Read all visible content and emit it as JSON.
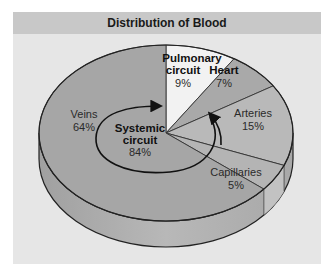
{
  "chart_data": {
    "type": "pie",
    "title": "Distribution of Blood",
    "style": "3d-extruded",
    "slices": [
      {
        "label": "Pulmonary circuit",
        "value": 9,
        "value_label": "9%",
        "color": "#f2f2f2",
        "bold": true
      },
      {
        "label": "Heart",
        "value": 7,
        "value_label": "7%",
        "color": "#a9a9a9",
        "bold": true
      },
      {
        "label": "Arteries",
        "value": 15,
        "value_label": "15%",
        "color": "#b9b9b9",
        "bold": false
      },
      {
        "label": "Capillaries",
        "value": 5,
        "value_label": "5%",
        "color": "#b4b4b4",
        "bold": false
      },
      {
        "label": "Veins",
        "value": 64,
        "value_label": "64%",
        "color": "#a6a6a6",
        "bold": false
      }
    ],
    "annotations": [
      {
        "label": "Systemic circuit",
        "value_label": "84%",
        "note": "Veins + Arteries + Capillaries, indicated by a curved arrow"
      }
    ]
  },
  "header": {
    "title": "Distribution of Blood"
  },
  "labels": {
    "pulmonary_1": "Pulmonary",
    "pulmonary_2": "circuit",
    "pulmonary_pct": "9%",
    "heart": "Heart",
    "heart_pct": "7%",
    "arteries": "Arteries",
    "arteries_pct": "15%",
    "capillaries": "Capillaries",
    "capillaries_pct": "5%",
    "veins": "Veins",
    "veins_pct": "64%",
    "systemic_1": "Systemic",
    "systemic_2": "circuit",
    "systemic_pct": "84%"
  },
  "colors": {
    "frame_bg": "#e6e6e6",
    "header_bg": "#c8c8c8",
    "side_dark": "#9a9a9a",
    "outline": "#222222"
  }
}
